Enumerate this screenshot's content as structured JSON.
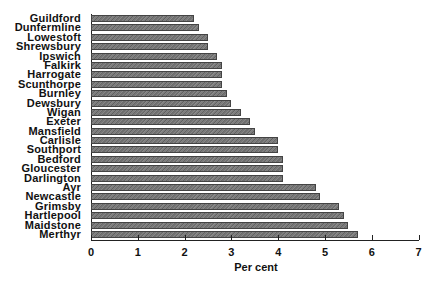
{
  "chart_data": {
    "type": "bar",
    "orientation": "horizontal",
    "title": "",
    "xlabel": "Per cent",
    "ylabel": "",
    "xlim": [
      0,
      7
    ],
    "xticks": [
      0,
      1,
      2,
      3,
      4,
      5,
      6,
      7
    ],
    "grid": false,
    "legend": null,
    "categories": [
      "Guildford",
      "Dunfermline",
      "Lowestoft",
      "Shrewsbury",
      "Ipswich",
      "Falkirk",
      "Harrogate",
      "Scunthorpe",
      "Burnley",
      "Dewsbury",
      "Wigan",
      "Exeter",
      "Mansfield",
      "Carlisle",
      "Southport",
      "Bedford",
      "Gloucester",
      "Darlington",
      "Ayr",
      "Newcastle",
      "Grimsby",
      "Hartlepool",
      "Maidstone",
      "Merthyr"
    ],
    "values": [
      2.2,
      2.3,
      2.5,
      2.5,
      2.7,
      2.8,
      2.8,
      2.8,
      2.9,
      3.0,
      3.2,
      3.4,
      3.5,
      4.0,
      4.0,
      4.1,
      4.1,
      4.1,
      4.8,
      4.9,
      5.3,
      5.4,
      5.5,
      5.7
    ],
    "bar_color": "#777777"
  }
}
